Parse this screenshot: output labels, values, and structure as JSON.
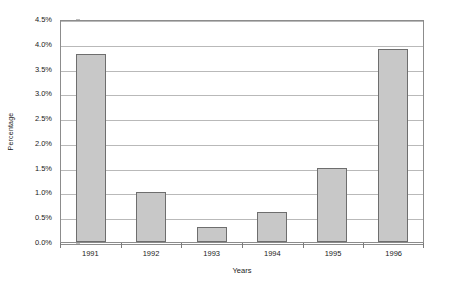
{
  "chart_data": {
    "type": "bar",
    "title": "",
    "categories": [
      "1991",
      "1992",
      "1993",
      "1994",
      "1995",
      "1996"
    ],
    "values": [
      3.8,
      1.0,
      0.3,
      0.6,
      1.5,
      3.9
    ],
    "series": [
      {
        "name": "Percentage",
        "values": [
          3.8,
          1.0,
          0.3,
          0.6,
          1.5,
          3.9
        ]
      }
    ],
    "xlabel": "Years",
    "ylabel": "Percentage",
    "ylim": [
      0.0,
      4.5
    ],
    "ytick_values": [
      0.0,
      0.5,
      1.0,
      1.5,
      2.0,
      2.5,
      3.0,
      3.5,
      4.0,
      4.5
    ],
    "ytick_labels": [
      "0.0%",
      "0.5%",
      "1.0%",
      "1.5%",
      "2.0%",
      "2.5%",
      "3.0%",
      "3.5%",
      "4.0%",
      "4.5%"
    ],
    "value_format": "percent",
    "grid": true,
    "grid_axis": "y",
    "legend": false,
    "legend_position": "none",
    "bar_fill_color": "#c8c8c8",
    "bar_border_color": "#6e6e6e",
    "gridline_color": "#b9b9b9",
    "axis_color": "#8c8c8c",
    "plot_background": "#ffffff"
  }
}
